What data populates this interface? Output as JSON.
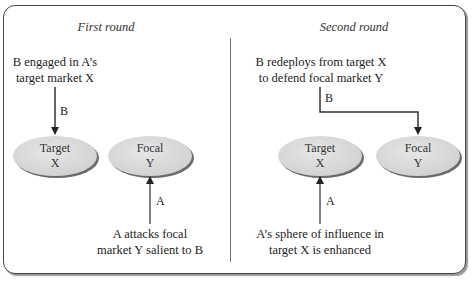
{
  "panels": [
    {
      "title": "First round",
      "top_text": [
        "B engaged in A’s",
        "target market X"
      ],
      "top_arrow_label": "B",
      "nodes": [
        {
          "line1": "Target",
          "line2": "X"
        },
        {
          "line1": "Focal",
          "line2": "Y"
        }
      ],
      "bottom_arrow_label": "A",
      "bottom_text": [
        "A attacks focal",
        "market Y salient to B"
      ]
    },
    {
      "title": "Second round",
      "top_text": [
        "B redeploys from target X",
        "to defend focal market Y"
      ],
      "top_arrow_label": "B",
      "nodes": [
        {
          "line1": "Target",
          "line2": "X"
        },
        {
          "line1": "Focal",
          "line2": "Y"
        }
      ],
      "bottom_arrow_label": "A",
      "bottom_text": [
        "A’s sphere of influence in",
        "target X is enhanced"
      ]
    }
  ],
  "colors": {
    "node_fill": "#dcdcdc",
    "node_shadow": "#555555",
    "arrow": "#333333",
    "frame": "#444444"
  }
}
